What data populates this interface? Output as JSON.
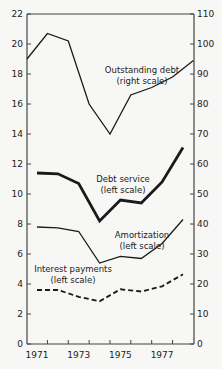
{
  "chart_data": {
    "type": "line",
    "title": "",
    "xlabel": "",
    "ylabel_left": "",
    "ylabel_right": "",
    "x": [
      1971,
      1972,
      1973,
      1974,
      1975,
      1976,
      1977,
      1978
    ],
    "x_tick_labels": [
      "1971",
      "1973",
      "1975",
      "1977"
    ],
    "x_tick_label_years": [
      1971,
      1973,
      1975,
      1977
    ],
    "left_axis": {
      "range": [
        0,
        22
      ],
      "ticks": [
        0,
        2,
        4,
        6,
        8,
        10,
        12,
        14,
        16,
        18,
        20,
        22
      ]
    },
    "right_axis": {
      "range": [
        0,
        110
      ],
      "ticks": [
        0,
        10,
        20,
        30,
        40,
        50,
        60,
        70,
        80,
        90,
        100,
        110
      ]
    },
    "grid": false,
    "legend": "inline annotations",
    "series": [
      {
        "name": "Outstanding debt",
        "annotation": [
          "Outstanding debt",
          "(right scale)"
        ],
        "axis": "right",
        "style": "thin",
        "x": [
          1970.5,
          1971.5,
          1972.5,
          1973.5,
          1974.5,
          1975.5,
          1976.5,
          1977.5,
          1978.5
        ],
        "values": [
          95,
          103.5,
          101,
          80,
          70,
          83,
          85.5,
          89,
          94.5
        ]
      },
      {
        "name": "Debt service",
        "annotation": [
          "Debt service",
          "(left scale)"
        ],
        "axis": "left",
        "style": "thick",
        "x": [
          1971,
          1972,
          1973,
          1974,
          1975,
          1976,
          1977,
          1978
        ],
        "values": [
          11.4,
          11.35,
          10.7,
          8.2,
          9.6,
          9.4,
          10.8,
          13.1
        ]
      },
      {
        "name": "Amortization",
        "annotation": [
          "Amortization",
          "(left scale)"
        ],
        "axis": "left",
        "style": "thin",
        "x": [
          1971,
          1972,
          1973,
          1974,
          1975,
          1976,
          1977,
          1978
        ],
        "values": [
          7.8,
          7.75,
          7.5,
          5.4,
          5.85,
          5.7,
          6.7,
          8.3
        ]
      },
      {
        "name": "Interest payments",
        "annotation": [
          "Interest payments",
          "(left scale)"
        ],
        "axis": "left",
        "style": "dashed",
        "x": [
          1971,
          1972,
          1973,
          1974,
          1975,
          1976,
          1977,
          1978
        ],
        "values": [
          3.6,
          3.6,
          3.15,
          2.85,
          3.65,
          3.5,
          3.85,
          4.65
        ]
      }
    ]
  },
  "colors": {
    "line": "#1a1a1a",
    "axis": "#444444",
    "background": "#f7f7f5"
  }
}
